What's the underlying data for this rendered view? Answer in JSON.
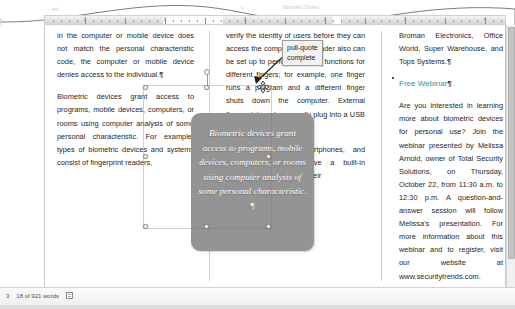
{
  "app": {
    "name": "Microsoft Word",
    "ribbon_ghost_labels": [
      "ert",
      "s",
      "WordArt Styles",
      "Arrar"
    ]
  },
  "ruler": {
    "name": "horizontal-ruler",
    "numbers": [
      "2",
      "1",
      "1",
      "2",
      "3",
      "4"
    ]
  },
  "document": {
    "columns": [
      {
        "id": "column-1",
        "paragraphs": [
          "in the computer or mobile device does not match the personal characteristic code, the computer or mobile device denies access to the individual.",
          "Biometric devices grant access to programs, mobile devices, computers, or rooms using computer analysis of some personal characteristic. For example, types of biometric devices and systems consist of fingerprint readers,"
        ]
      },
      {
        "id": "column-2",
        "paragraphs": [
          "verify the identity of users before they can access the computer. The reader also can be set up to perform different functions for different fingers; for example, one finger runs a program and a different finger shuts down the computer. External fingerprint readers usually plug into a USB port.",
          "Mobile computers, smartphones, and smartwatches often have a built-in fingerprint reader. Using their"
        ]
      },
      {
        "id": "column-3",
        "paragraphs": [
          "Broman Electronics, Office World, Super Warehouse, and Tops Systems.",
          "Are you interested in learning more about biometric devices for personal use? Join the webinar presented by Melissa Arnold, owner of Total Security Solutions, on Thursday, October 22, from 11:30 a.m. to 12:30 p.m. A question-and-answer session will follow Melissa's presentation. For more information about this webinar and to register, visit our website at www.securitytrends.com."
        ],
        "heading": "Free Webinar"
      }
    ],
    "pilcrow": "¶"
  },
  "pull_quote": {
    "name": "pull-quote-shape",
    "text": "Biometric devices grant access to programs, mobile devices, computers, or rooms using computer analysis of some personal characteristic. ¶",
    "fill_color": "#949494",
    "text_color": "#ffffff"
  },
  "tooltip": {
    "name": "pull-quote-tooltip",
    "line1": "pull-quote",
    "line2": "complete"
  },
  "status_bar": {
    "page": "3",
    "word_count": "18 of 921 words",
    "proofing_icon": "proofing-errors-icon"
  },
  "colors": {
    "heading_teal": "#2e9a8f",
    "shape_gray": "#949494",
    "body_text": "#26262a"
  }
}
